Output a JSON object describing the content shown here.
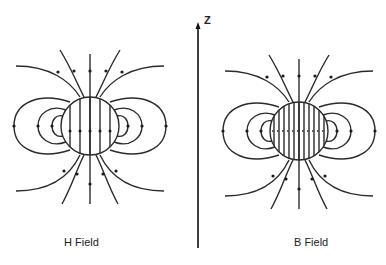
{
  "figure": {
    "axis_label": "Z",
    "panels": [
      {
        "id": "h",
        "label": "H Field",
        "center": [
          90,
          126
        ],
        "radius": 29,
        "interior_lines": 5
      },
      {
        "id": "b",
        "label": "B Field",
        "center": [
          299,
          131
        ],
        "radius": 29,
        "interior_lines": 11
      }
    ],
    "colors": {
      "line": "#2a2a2a",
      "background": "#ffffff"
    }
  }
}
